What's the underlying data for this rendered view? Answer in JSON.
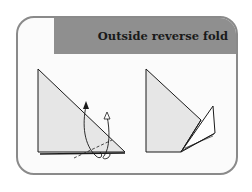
{
  "title": "Outside reverse fold",
  "colors": {
    "banner": "#8f8f8f",
    "border": "#8a8a8a",
    "paper": "#e6e6e6",
    "line": "#1a1a1a"
  },
  "steps": [
    {
      "label": "before",
      "description": "Triangle with dashed fold line and arrows indicating outside reverse fold"
    },
    {
      "label": "after",
      "description": "Triangle with tip folded outward as reverse fold"
    }
  ]
}
